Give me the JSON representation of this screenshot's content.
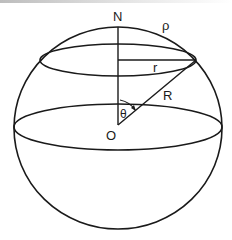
{
  "diagram": {
    "labels": {
      "north": "N",
      "arc_length": "ρ",
      "cap_radius": "r",
      "sphere_radius": "R",
      "angle": "θ",
      "center": "O"
    },
    "colors": {
      "stroke": "#1a1a1a",
      "background": "#ffffff"
    }
  }
}
